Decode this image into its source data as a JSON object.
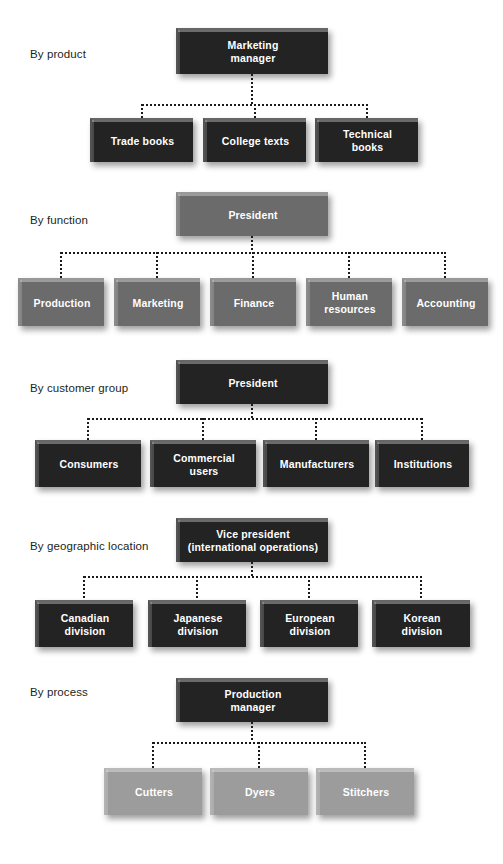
{
  "diagram": {
    "background_color": "#ffffff",
    "box_colors": {
      "dark": "#232323",
      "mid": "#6b6b6b",
      "light": "#9c9c9c"
    },
    "connector_color": "#1a1a1a",
    "connector_style": "dotted"
  },
  "sections": [
    {
      "label": "By product",
      "shade": "dark",
      "parent": {
        "lines": [
          "Marketing",
          "manager"
        ]
      },
      "children": [
        {
          "lines": [
            "Trade books"
          ]
        },
        {
          "lines": [
            "College texts"
          ]
        },
        {
          "lines": [
            "Technical",
            "books"
          ]
        }
      ]
    },
    {
      "label": "By function",
      "shade": "mid",
      "parent": {
        "lines": [
          "President"
        ]
      },
      "children": [
        {
          "lines": [
            "Production"
          ]
        },
        {
          "lines": [
            "Marketing"
          ]
        },
        {
          "lines": [
            "Finance"
          ]
        },
        {
          "lines": [
            "Human",
            "resources"
          ]
        },
        {
          "lines": [
            "Accounting"
          ]
        }
      ]
    },
    {
      "label": "By customer group",
      "shade": "dark",
      "parent": {
        "lines": [
          "President"
        ]
      },
      "children": [
        {
          "lines": [
            "Consumers"
          ]
        },
        {
          "lines": [
            "Commercial",
            "users"
          ]
        },
        {
          "lines": [
            "Manufacturers"
          ]
        },
        {
          "lines": [
            "Institutions"
          ]
        }
      ]
    },
    {
      "label": "By geographic location",
      "shade": "dark",
      "parent": {
        "lines": [
          "Vice president",
          "(international operations)"
        ]
      },
      "children": [
        {
          "lines": [
            "Canadian",
            "division"
          ]
        },
        {
          "lines": [
            "Japanese",
            "division"
          ]
        },
        {
          "lines": [
            "European",
            "division"
          ]
        },
        {
          "lines": [
            "Korean",
            "division"
          ]
        }
      ]
    },
    {
      "label": "By process",
      "shade": "light",
      "parent": {
        "lines": [
          "Production",
          "manager"
        ],
        "shade": "dark"
      },
      "children": [
        {
          "lines": [
            "Cutters"
          ]
        },
        {
          "lines": [
            "Dyers"
          ]
        },
        {
          "lines": [
            "Stitchers"
          ]
        }
      ]
    }
  ],
  "layout": [
    {
      "label_x": 30,
      "label_y": 48,
      "parent": {
        "x": 176,
        "y": 28,
        "w": 152,
        "h": 46
      },
      "bus_y": 104,
      "stub_top": 74,
      "drop_to": 118,
      "children": [
        {
          "x": 90,
          "y": 118,
          "w": 103,
          "h": 44
        },
        {
          "x": 203,
          "y": 118,
          "w": 103,
          "h": 44
        },
        {
          "x": 315,
          "y": 118,
          "w": 103,
          "h": 44
        }
      ]
    },
    {
      "label_x": 30,
      "label_y": 214,
      "parent": {
        "x": 176,
        "y": 192,
        "w": 152,
        "h": 44
      },
      "bus_y": 252,
      "stub_top": 236,
      "drop_to": 278,
      "children": [
        {
          "x": 18,
          "y": 278,
          "w": 86,
          "h": 48
        },
        {
          "x": 114,
          "y": 278,
          "w": 86,
          "h": 48
        },
        {
          "x": 210,
          "y": 278,
          "w": 86,
          "h": 48
        },
        {
          "x": 306,
          "y": 278,
          "w": 86,
          "h": 48
        },
        {
          "x": 402,
          "y": 278,
          "w": 86,
          "h": 48
        }
      ]
    },
    {
      "label_x": 30,
      "label_y": 382,
      "parent": {
        "x": 176,
        "y": 360,
        "w": 152,
        "h": 44
      },
      "bus_y": 418,
      "stub_top": 404,
      "drop_to": 440,
      "children": [
        {
          "x": 35,
          "y": 440,
          "w": 106,
          "h": 47
        },
        {
          "x": 150,
          "y": 440,
          "w": 106,
          "h": 47
        },
        {
          "x": 263,
          "y": 440,
          "w": 106,
          "h": 47
        },
        {
          "x": 375,
          "y": 440,
          "w": 94,
          "h": 47
        }
      ]
    },
    {
      "label_x": 30,
      "label_y": 540,
      "parent": {
        "x": 176,
        "y": 518,
        "w": 152,
        "h": 44
      },
      "bus_y": 576,
      "stub_top": 562,
      "drop_to": 600,
      "children": [
        {
          "x": 35,
          "y": 600,
          "w": 98,
          "h": 47
        },
        {
          "x": 148,
          "y": 600,
          "w": 98,
          "h": 47
        },
        {
          "x": 260,
          "y": 600,
          "w": 98,
          "h": 47
        },
        {
          "x": 372,
          "y": 600,
          "w": 98,
          "h": 47
        }
      ]
    },
    {
      "label_x": 30,
      "label_y": 686,
      "parent": {
        "x": 176,
        "y": 678,
        "w": 152,
        "h": 44
      },
      "bus_y": 742,
      "stub_top": 722,
      "drop_to": 768,
      "children": [
        {
          "x": 104,
          "y": 768,
          "w": 98,
          "h": 47
        },
        {
          "x": 210,
          "y": 768,
          "w": 98,
          "h": 47
        },
        {
          "x": 316,
          "y": 768,
          "w": 98,
          "h": 47
        }
      ]
    }
  ]
}
